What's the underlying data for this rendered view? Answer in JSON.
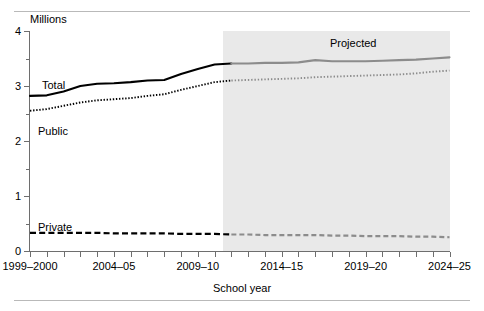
{
  "figure": {
    "y_axis_unit_label": "Millions",
    "x_axis_title": "School year",
    "projection_label": "Projected",
    "projection_start_year": "2011-12",
    "series_labels": {
      "total": "Total",
      "public": "Public",
      "private": "Private"
    },
    "colors": {
      "actual_line": "#000000",
      "projected_line": "#8c8c8c",
      "projection_band": "#e9e9e9",
      "axis": "#6e6e6e",
      "rule": "#b9b9b9"
    }
  },
  "axes": {
    "y_ticks": [
      "0",
      "1",
      "2",
      "3",
      "4"
    ],
    "y_minor_ticks": [
      0.5,
      1.5,
      2.5,
      3.5
    ],
    "ylim": [
      0,
      4
    ],
    "x_labels": [
      "1999–2000",
      "2004–05",
      "2009–10",
      "2014–15",
      "2019–20",
      "2024–25"
    ],
    "x_label_indices": [
      0,
      5,
      10,
      15,
      20,
      25
    ],
    "x_tick_count": 26
  },
  "chart_data": {
    "type": "line",
    "title": "",
    "subtitle": "",
    "xlabel": "School year",
    "ylabel": "Millions",
    "ylim": [
      0,
      4
    ],
    "grid": false,
    "legend": "inline-labels",
    "annotations": [
      {
        "text": "Projected",
        "x_year": "2017–18",
        "y": 3.72
      }
    ],
    "x": [
      "1999–2000",
      "2000–01",
      "2001–02",
      "2002–03",
      "2003–04",
      "2004–05",
      "2005–06",
      "2006–07",
      "2007–08",
      "2008–09",
      "2009–10",
      "2010–11",
      "2011–12",
      "2012–13",
      "2013–14",
      "2014–15",
      "2015–16",
      "2016–17",
      "2017–18",
      "2018–19",
      "2019–20",
      "2020–21",
      "2021–22",
      "2022–23",
      "2023–24",
      "2024–25"
    ],
    "projected_from_index": 12,
    "series": [
      {
        "name": "Total",
        "style": "solid",
        "values": [
          2.82,
          2.83,
          2.9,
          3.0,
          3.04,
          3.05,
          3.07,
          3.1,
          3.11,
          3.22,
          3.31,
          3.39,
          3.41,
          3.41,
          3.42,
          3.42,
          3.43,
          3.47,
          3.45,
          3.45,
          3.45,
          3.46,
          3.47,
          3.48,
          3.5,
          3.52
        ]
      },
      {
        "name": "Public",
        "style": "dotted",
        "values": [
          2.55,
          2.58,
          2.64,
          2.7,
          2.74,
          2.76,
          2.78,
          2.82,
          2.85,
          2.93,
          3.0,
          3.07,
          3.1,
          3.11,
          3.12,
          3.13,
          3.14,
          3.16,
          3.17,
          3.18,
          3.19,
          3.2,
          3.21,
          3.23,
          3.26,
          3.28
        ]
      },
      {
        "name": "Private",
        "style": "dashed",
        "values": [
          0.33,
          0.33,
          0.33,
          0.33,
          0.33,
          0.32,
          0.32,
          0.32,
          0.32,
          0.31,
          0.31,
          0.31,
          0.3,
          0.3,
          0.29,
          0.29,
          0.29,
          0.29,
          0.28,
          0.28,
          0.27,
          0.27,
          0.27,
          0.26,
          0.26,
          0.25
        ]
      }
    ]
  }
}
